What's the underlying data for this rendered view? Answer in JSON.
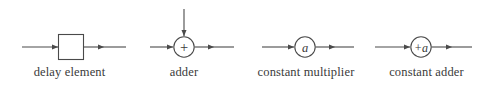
{
  "figure": {
    "background_color": "#ffffff",
    "line_color": "#4a4a4a",
    "text_color": "#3a3a3a"
  },
  "blocks": [
    {
      "key": "delay_element",
      "caption": "delay element",
      "symbol_type": "rectangle",
      "symbol_text": "",
      "inputs": [
        "left"
      ],
      "outputs": [
        "right"
      ]
    },
    {
      "key": "adder",
      "caption": "adder",
      "symbol_type": "circle",
      "symbol_text": "+",
      "inputs": [
        "left",
        "top"
      ],
      "outputs": [
        "right"
      ]
    },
    {
      "key": "constant_multiplier",
      "caption": "constant multiplier",
      "symbol_type": "circle",
      "symbol_text": "a",
      "symbol_style": "italic",
      "inputs": [
        "left"
      ],
      "outputs": [
        "right"
      ]
    },
    {
      "key": "constant_adder",
      "caption": "constant adder",
      "symbol_type": "circle",
      "symbol_text": "+a",
      "symbol_style": "italic",
      "inputs": [
        "left"
      ],
      "outputs": [
        "right"
      ]
    }
  ]
}
